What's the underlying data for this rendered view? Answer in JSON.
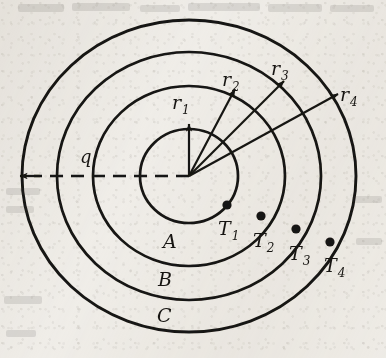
{
  "figure": {
    "type": "technical-diagram",
    "background_color": "#f2f0ec",
    "ink_color": "#171512",
    "center": {
      "x": 189,
      "y": 176
    },
    "circles": [
      {
        "id": "circle-1",
        "radius_x": 49,
        "radius_y": 47,
        "label": ""
      },
      {
        "id": "circle-2",
        "radius_x": 96,
        "radius_y": 90,
        "label": "A"
      },
      {
        "id": "circle-3",
        "radius_x": 132,
        "radius_y": 124,
        "label": "B"
      },
      {
        "id": "circle-4",
        "radius_x": 167,
        "radius_y": 156,
        "label": "C"
      }
    ],
    "radius_arrows": [
      {
        "id": "r1",
        "base": "r",
        "sub": "1",
        "angle_deg": 90,
        "length": 52,
        "label_x": 176,
        "label_y": 108
      },
      {
        "id": "r2",
        "base": "r",
        "sub": "2",
        "angle_deg": 62,
        "length": 99,
        "label_x": 227,
        "label_y": 86
      },
      {
        "id": "r3",
        "base": "r",
        "sub": "3",
        "angle_deg": 45,
        "length": 135,
        "label_x": 275,
        "label_y": 75
      },
      {
        "id": "r4",
        "base": "r",
        "sub": "4",
        "angle_deg": 29,
        "length": 170,
        "label_x": 343,
        "label_y": 101
      }
    ],
    "temperature_points": [
      {
        "id": "T1",
        "base": "T",
        "sub": "1",
        "x": 227,
        "y": 205,
        "label_x": 232,
        "label_y": 233
      },
      {
        "id": "T2",
        "base": "T",
        "sub": "2",
        "x": 261,
        "y": 216,
        "label_x": 266,
        "label_y": 245
      },
      {
        "id": "T3",
        "base": "T",
        "sub": "3",
        "x": 296,
        "y": 229,
        "label_x": 300,
        "label_y": 257
      },
      {
        "id": "T4",
        "base": "T",
        "sub": "4",
        "x": 330,
        "y": 242,
        "label_x": 334,
        "label_y": 269
      }
    ],
    "layer_labels": [
      {
        "id": "A",
        "text": "A",
        "x": 168,
        "y": 247
      },
      {
        "id": "B",
        "text": "B",
        "x": 163,
        "y": 285
      },
      {
        "id": "C",
        "text": "C",
        "x": 162,
        "y": 321
      }
    ],
    "heat_flux": {
      "id": "q",
      "text": "q",
      "label_x": 83,
      "label_y": 162,
      "arrow_from_x": 189,
      "arrow_from_y": 176,
      "arrow_to_x": 20,
      "arrow_to_y": 176,
      "line_style": "dashed"
    },
    "bleed_through_top": "scanned page show-through"
  }
}
